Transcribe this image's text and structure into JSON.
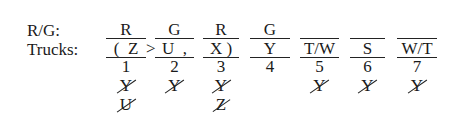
{
  "labels": {
    "rg": "R/G:",
    "trucks": "Trucks:"
  },
  "columns": [
    {
      "rg": "R",
      "truck": "(  Z",
      "num": "1",
      "eliminated": [
        "Y",
        "U"
      ]
    },
    {
      "rg": "G",
      "truck": "U  ,",
      "num": "2",
      "eliminated": [
        "Y"
      ]
    },
    {
      "rg": "R",
      "truck": "X )",
      "num": "3",
      "eliminated": [
        "Y",
        "Z"
      ]
    },
    {
      "rg": "G",
      "truck": "Y",
      "num": "4",
      "eliminated": []
    },
    {
      "rg": "",
      "truck": "T/W",
      "num": "5",
      "eliminated": [
        "Y"
      ]
    },
    {
      "rg": "",
      "truck": "S",
      "num": "6",
      "eliminated": [
        "Y"
      ]
    },
    {
      "rg": "",
      "truck": "W/T",
      "num": "7",
      "eliminated": [
        "Y"
      ]
    }
  ],
  "relation": {
    "symbol": ">"
  }
}
